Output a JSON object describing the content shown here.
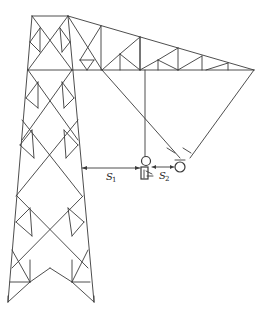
{
  "diagram": {
    "labels": {
      "s1_main": "S",
      "s1_sub": "1",
      "s2_main": "S",
      "s2_sub": "2"
    },
    "colors": {
      "line": "#3a3a3a",
      "background": "#ffffff"
    },
    "elements": [
      "tower-body",
      "cross-arm",
      "insulator-string",
      "conductor",
      "worker-figure",
      "s1-dimension",
      "s2-dimension"
    ]
  }
}
